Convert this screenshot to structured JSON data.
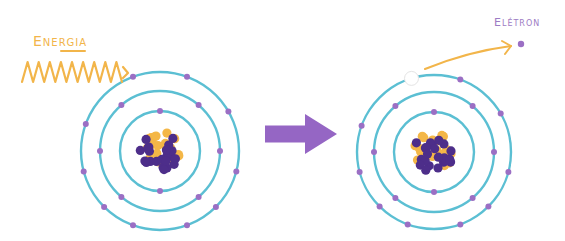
{
  "diagram": {
    "colors": {
      "orbit": "#5bbfd3",
      "electron": "#9b6fc4",
      "proton": "#4d2e8a",
      "neutron": "#f4b747",
      "energy": "#f2b54a",
      "arrow": "#9566c4",
      "vacancy_fill": "#ffffff",
      "vacancy_stroke": "#e4e4e4",
      "label_energy": "#f2b54a",
      "label_electron": "#9d7cc4"
    },
    "labels": {
      "energy": "Energia",
      "electron": "Elétron"
    },
    "energy_wave": {
      "x_start": 22,
      "x_end": 128,
      "y_center": 72,
      "amplitude": 10,
      "peaks": 9
    },
    "process_arrow": {
      "x": 265,
      "y": 134,
      "shaft_length": 40,
      "shaft_height": 17,
      "head_length": 32,
      "head_height": 40
    },
    "atoms": [
      {
        "id": "before",
        "center": [
          160,
          151
        ],
        "orbits": [
          {
            "radius": 40,
            "electron_angles": [
              270,
              90
            ]
          },
          {
            "radius": 60,
            "electron_angles": [
              230,
              310,
              0,
              50,
              130,
              180
            ]
          },
          {
            "radius": 79,
            "electron_angles": [
              250,
              290,
              330,
              15,
              45,
              70,
              110,
              135,
              165,
              200
            ]
          }
        ],
        "vacancy": null
      },
      {
        "id": "after",
        "center": [
          434,
          152
        ],
        "orbits": [
          {
            "radius": 40,
            "electron_angles": [
              270,
              90
            ]
          },
          {
            "radius": 60,
            "electron_angles": [
              230,
              310,
              0,
              50,
              130,
              180
            ]
          },
          {
            "radius": 77,
            "electron_angles": [
              290,
              330,
              15,
              45,
              70,
              110,
              135,
              165,
              200
            ]
          }
        ],
        "vacancy": {
          "angle": 253,
          "radius": 77
        }
      }
    ],
    "ejected_electron": {
      "x": 521,
      "y": 44,
      "arrow_from": [
        425,
        69
      ],
      "arrow_to": [
        511,
        46
      ]
    }
  }
}
